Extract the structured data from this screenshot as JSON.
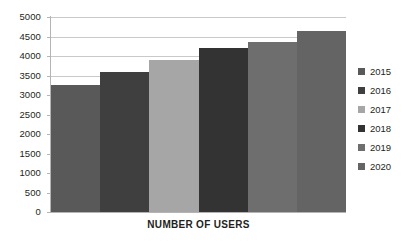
{
  "chart_data": {
    "type": "bar",
    "title": "",
    "subtitle": "",
    "xlabel": "NUMBER OF USERS",
    "ylabel": "",
    "categories": [
      "2015",
      "2016",
      "2017",
      "2018",
      "2019",
      "2020"
    ],
    "values": [
      3250,
      3600,
      3900,
      4200,
      4350,
      4650
    ],
    "series": [
      {
        "name": "Users",
        "values": [
          3250,
          3600,
          3900,
          4200,
          4350,
          4650
        ]
      }
    ],
    "ylim": [
      0,
      5000
    ],
    "ytick_labels": [
      "5000",
      "4500",
      "4000",
      "3500",
      "3000",
      "2500",
      "2000",
      "1500",
      "1000",
      "500",
      "0"
    ],
    "ytick_values": [
      5000,
      4500,
      4000,
      3500,
      3000,
      2500,
      2000,
      1500,
      1000,
      500,
      0
    ],
    "ytick_step": 500,
    "grid": true,
    "grid_axis": "y",
    "legend_position": "right",
    "legend_entries": [
      {
        "label": "2015",
        "color": "#595959"
      },
      {
        "label": "2016",
        "color": "#3f3f3f"
      },
      {
        "label": "2017",
        "color": "#a6a6a6"
      },
      {
        "label": "2018",
        "color": "#333333"
      },
      {
        "label": "2019",
        "color": "#6e6e6e"
      },
      {
        "label": "2020",
        "color": "#646464"
      }
    ],
    "bar_colors": [
      "#595959",
      "#3f3f3f",
      "#a6a6a6",
      "#333333",
      "#6e6e6e",
      "#646464"
    ],
    "bar_gap": 0,
    "axis_color": "#b4b4b4",
    "gridline_color": "#c9c9c9",
    "background_color": "#ffffff",
    "text_color": "#231f20",
    "annotations": []
  }
}
